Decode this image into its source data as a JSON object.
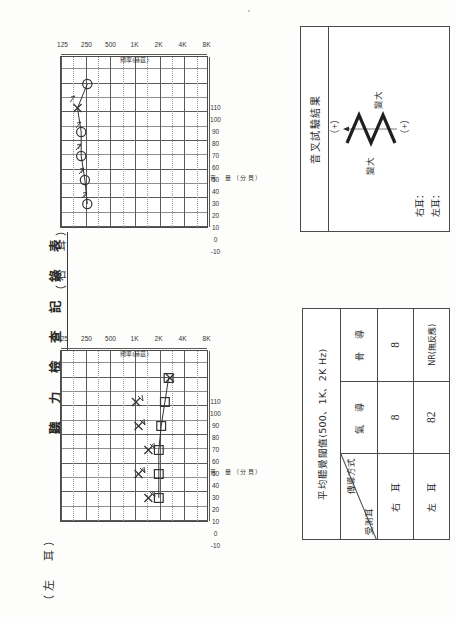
{
  "document": {
    "title": "聽 力 檢 查 記 錄 表"
  },
  "speckle": "",
  "sections": {
    "right_ear_caption": "（右　耳）",
    "left_ear_caption": "（左　耳）"
  },
  "axis": {
    "db_title": "音　量（分貝）",
    "hz_title": "頻率(赫茲)",
    "db_ticks": [
      "-10",
      "0",
      "10",
      "20",
      "30",
      "40",
      "50",
      "60",
      "70",
      "80",
      "90",
      "100",
      "110"
    ],
    "hz_ticks": [
      "125",
      "250",
      "500",
      "1K",
      "2K",
      "4K",
      "8K"
    ]
  },
  "fork_box": {
    "title": "音叉試驗結果",
    "plus_top": "（+）",
    "plus_bottom": "（+）",
    "louder_left": "變大",
    "louder_right": "變大",
    "right_ear_label": "右耳：",
    "left_ear_label": "左耳："
  },
  "avg_table": {
    "header": "平均聽覺閾值(500、1K、2K Hz)",
    "corner_upper": "傳導方式",
    "corner_lower": "受測耳",
    "columns": [
      "氣　導",
      "骨　導"
    ],
    "rows": [
      {
        "ear": "右　耳",
        "air": "8",
        "bone": "8"
      },
      {
        "ear": "左　耳",
        "air": "82",
        "bone": "NR(無反應)"
      }
    ]
  },
  "chart_data": [
    {
      "type": "line",
      "title": "（右　耳）",
      "xlabel": "頻率(赫茲)",
      "ylabel": "音　量（分貝）",
      "categories": [
        "125",
        "250",
        "500",
        "1K",
        "2K",
        "4K",
        "8K"
      ],
      "ylim": [
        -10,
        110
      ],
      "grid": true,
      "series": [
        {
          "name": "右耳氣導（O）",
          "marker": "circle",
          "x": [
            "250",
            "500",
            "1K",
            "2K",
            "4K",
            "8K"
          ],
          "values": [
            10,
            8,
            5,
            5,
            2,
            10
          ]
        },
        {
          "name": "右耳骨導遮蔽（X 註記）",
          "marker": "x",
          "x": [
            "4K"
          ],
          "values": [
            2
          ]
        }
      ]
    },
    {
      "type": "line",
      "title": "（左　耳）",
      "xlabel": "頻率(赫茲)",
      "ylabel": "音　量（分貝）",
      "categories": [
        "125",
        "250",
        "500",
        "1K",
        "2K",
        "4K",
        "8K"
      ],
      "ylim": [
        -10,
        110
      ],
      "grid": true,
      "series": [
        {
          "name": "左耳氣導（X）",
          "marker": "x",
          "x": [
            "250",
            "500",
            "1K",
            "2K",
            "4K",
            "8K"
          ],
          "values": [
            70,
            62,
            70,
            62,
            60,
            88
          ]
        },
        {
          "name": "左耳無反應（□ 加下箭頭）",
          "marker": "square-arrow-down",
          "x": [
            "250",
            "500",
            "1K",
            "2K",
            "4K",
            "8K"
          ],
          "values": [
            80,
            80,
            80,
            82,
            85,
            88
          ]
        }
      ]
    }
  ]
}
